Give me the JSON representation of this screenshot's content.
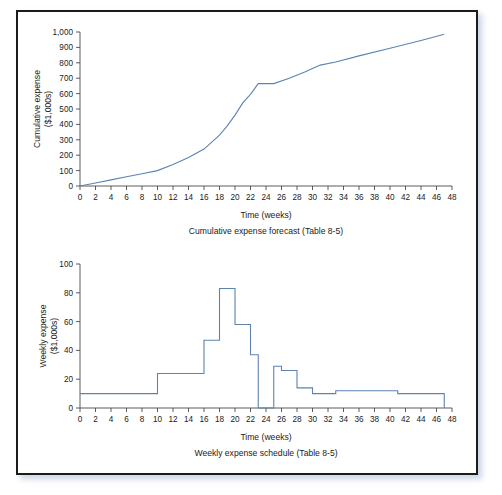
{
  "figure": {
    "border_color": "#1b1b1b",
    "background_color": "#ffffff",
    "series_color": "#5b84b1"
  },
  "chart_data": [
    {
      "id": "cumulative-expense-forecast",
      "type": "line",
      "title": "",
      "caption": "Cumulative expense forecast (Table 8-5)",
      "xlabel": "Time (weeks)",
      "ylabel": "Cumulative expense\n($1,000s)",
      "ylabel_line1": "Cumulative expense",
      "ylabel_line2": "($1,000s)",
      "xlim": [
        0,
        48
      ],
      "ylim": [
        0,
        1000
      ],
      "xticks": [
        0,
        2,
        4,
        6,
        8,
        10,
        12,
        14,
        16,
        18,
        20,
        22,
        24,
        26,
        28,
        30,
        32,
        34,
        36,
        38,
        40,
        42,
        44,
        46,
        48
      ],
      "xtick_labels": [
        "0",
        "2",
        "4",
        "6",
        "8",
        "10",
        "12",
        "14",
        "16",
        "18",
        "20",
        "22",
        "24",
        "26",
        "28",
        "30",
        "32",
        "34",
        "36",
        "38",
        "40",
        "42",
        "44",
        "46",
        "48"
      ],
      "yticks": [
        0,
        100,
        200,
        300,
        400,
        500,
        600,
        700,
        800,
        900,
        1000
      ],
      "ytick_labels": [
        "0",
        "100",
        "200",
        "300",
        "400",
        "500",
        "600",
        "700",
        "800",
        "900",
        "1,000"
      ],
      "grid": false,
      "legend": "none",
      "line_color": "#5b84b1",
      "line_width": 1.1,
      "x": [
        0,
        2,
        4,
        6,
        8,
        10,
        12,
        14,
        16,
        18,
        19,
        20,
        21,
        22,
        23,
        25,
        27,
        29,
        31,
        33,
        36,
        40,
        44,
        47
      ],
      "y": [
        0,
        20,
        40,
        60,
        80,
        100,
        140,
        185,
        240,
        330,
        390,
        460,
        540,
        595,
        665,
        665,
        700,
        740,
        785,
        805,
        845,
        895,
        945,
        985
      ]
    },
    {
      "id": "weekly-expense-schedule",
      "type": "bar",
      "title": "",
      "caption": "Weekly expense schedule (Table 8-5)",
      "xlabel": "Time (weeks)",
      "ylabel": "Weekly expense\n($1,000s)",
      "ylabel_line1": "Weekly expense",
      "ylabel_line2": "($1,000s)",
      "xlim": [
        0,
        48
      ],
      "ylim": [
        0,
        100
      ],
      "xticks": [
        0,
        2,
        4,
        6,
        8,
        10,
        12,
        14,
        16,
        18,
        20,
        22,
        24,
        26,
        28,
        30,
        32,
        34,
        36,
        38,
        40,
        42,
        44,
        46,
        48
      ],
      "xtick_labels": [
        "0",
        "2",
        "4",
        "6",
        "8",
        "10",
        "12",
        "14",
        "16",
        "18",
        "20",
        "22",
        "24",
        "26",
        "28",
        "30",
        "32",
        "34",
        "36",
        "38",
        "40",
        "42",
        "44",
        "46",
        "48"
      ],
      "yticks": [
        0,
        20,
        40,
        60,
        80,
        100
      ],
      "ytick_labels": [
        "0",
        "20",
        "40",
        "60",
        "80",
        "100"
      ],
      "grid": false,
      "legend": "none",
      "line_color": "#5b84b1",
      "line_width": 1.1,
      "step_intervals": [
        {
          "x0": 0,
          "x1": 10,
          "value": 10
        },
        {
          "x0": 10,
          "x1": 16,
          "value": 24
        },
        {
          "x0": 16,
          "x1": 18,
          "value": 47
        },
        {
          "x0": 18,
          "x1": 20,
          "value": 83
        },
        {
          "x0": 20,
          "x1": 22,
          "value": 58
        },
        {
          "x0": 22,
          "x1": 23,
          "value": 37
        },
        {
          "x0": 23,
          "x1": 25,
          "value": 0
        },
        {
          "x0": 25,
          "x1": 26,
          "value": 29
        },
        {
          "x0": 26,
          "x1": 28,
          "value": 26
        },
        {
          "x0": 28,
          "x1": 30,
          "value": 14
        },
        {
          "x0": 30,
          "x1": 33,
          "value": 10
        },
        {
          "x0": 33,
          "x1": 41,
          "value": 12
        },
        {
          "x0": 41,
          "x1": 47,
          "value": 10
        }
      ]
    }
  ]
}
